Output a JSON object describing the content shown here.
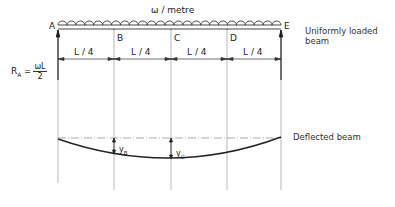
{
  "diagram": {
    "load_label": "ω / metre",
    "points": [
      {
        "name": "A",
        "x": 58
      },
      {
        "name": "B",
        "x": 114
      },
      {
        "name": "C",
        "x": 171
      },
      {
        "name": "D",
        "x": 227
      },
      {
        "name": "E",
        "x": 281
      }
    ],
    "spans": [
      "L / 4",
      "L / 4",
      "L / 4",
      "L / 4"
    ],
    "reaction": {
      "symbol": "R",
      "subscript": "A",
      "equals": "=",
      "numerator": "ωL",
      "denominator": "2"
    },
    "titles": {
      "loaded_beam": [
        "Uniformly loaded",
        "beam"
      ],
      "deflected_beam": "Deflected beam"
    },
    "deflections": [
      {
        "symbol": "y",
        "subscript": "B"
      },
      {
        "symbol": "y",
        "subscript": "C"
      }
    ]
  }
}
